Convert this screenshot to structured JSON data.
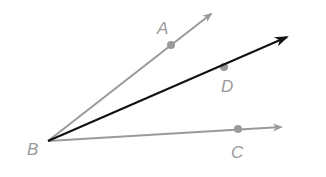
{
  "diagram": {
    "colors": {
      "gray_ray": "#9a9a9a",
      "bisector": "#111111",
      "background": "#ffffff"
    },
    "vertex": {
      "label": "B",
      "x": 48,
      "y": 141,
      "label_x": 27,
      "label_y": 155
    },
    "rays": [
      {
        "name": "ray-BA",
        "point_label": "A",
        "point": [
          171,
          45
        ],
        "tip": [
          213,
          12
        ],
        "label_pos": [
          157,
          34
        ],
        "color": "#9a9a9a"
      },
      {
        "name": "ray-BD",
        "point_label": "D",
        "point": [
          224,
          67
        ],
        "tip": [
          290,
          36
        ],
        "label_pos": [
          221,
          92
        ],
        "color": "#111111"
      },
      {
        "name": "ray-BC",
        "point_label": "C",
        "point": [
          238,
          129
        ],
        "tip": [
          283,
          127
        ],
        "label_pos": [
          231,
          158
        ],
        "color": "#9a9a9a"
      }
    ],
    "labels": {
      "A": "A",
      "B": "B",
      "C": "C",
      "D": "D"
    }
  }
}
